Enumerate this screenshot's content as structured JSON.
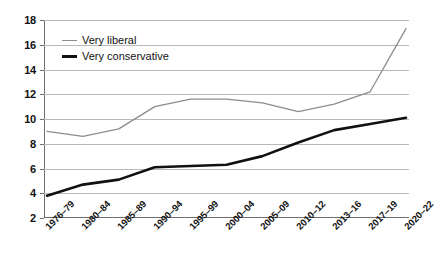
{
  "chart_data": {
    "type": "line",
    "title": "",
    "xlabel": "",
    "ylabel": "",
    "categories": [
      "1976–79",
      "1980–84",
      "1985–89",
      "1990–94",
      "1995–99",
      "2000–04",
      "2005–09",
      "2010–12",
      "2013–16",
      "2017–19",
      "2020–22"
    ],
    "series": [
      {
        "name": "Very liberal",
        "color": "#8c8c8c",
        "values": [
          9.0,
          8.6,
          9.2,
          11.0,
          11.6,
          11.6,
          11.3,
          10.6,
          11.2,
          12.2,
          17.3
        ]
      },
      {
        "name": "Very conservative",
        "color": "#111111",
        "values": [
          3.8,
          4.7,
          5.1,
          6.1,
          6.2,
          6.3,
          7.0,
          8.1,
          9.1,
          9.6,
          10.1
        ]
      }
    ],
    "ylim": [
      2,
      18
    ],
    "yticks": [
      2,
      4,
      6,
      8,
      10,
      12,
      14,
      16,
      18
    ],
    "ytick_labels": [
      "2",
      "4",
      "6",
      "8",
      "10",
      "12",
      "14",
      "16",
      "18"
    ],
    "grid": true,
    "legend_position": "top-left"
  }
}
